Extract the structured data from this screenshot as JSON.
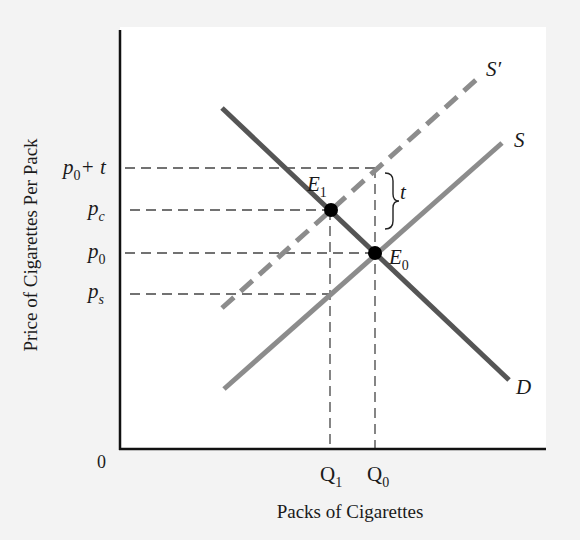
{
  "diagram": {
    "type": "supply-demand-tax",
    "axes": {
      "x_label": "Packs of Cigarettes",
      "y_label": "Price of  Cigarettes Per Pack",
      "origin_label": "0"
    },
    "y_ticks": [
      {
        "id": "p0_plus_t",
        "base": "p",
        "sub": "0",
        "suffix": "+ t",
        "y": 168
      },
      {
        "id": "pc",
        "base": "p",
        "sub": "c",
        "suffix": "",
        "y": 210
      },
      {
        "id": "p0",
        "base": "p",
        "sub": "0",
        "suffix": "",
        "y": 253
      },
      {
        "id": "ps",
        "base": "p",
        "sub": "s",
        "suffix": "",
        "y": 294
      }
    ],
    "x_ticks": [
      {
        "id": "Q1",
        "base": "Q",
        "sub": "1",
        "x": 330
      },
      {
        "id": "Q0",
        "base": "Q",
        "sub": "0",
        "x": 375
      }
    ],
    "curves": [
      {
        "id": "D",
        "label": "D",
        "style": "solid",
        "color": "#555555",
        "from": [
          222,
          108
        ],
        "to": [
          509,
          380
        ]
      },
      {
        "id": "S",
        "label": "S",
        "style": "solid",
        "color": "#8c8c8c",
        "from": [
          224,
          389
        ],
        "to": [
          502,
          143
        ]
      },
      {
        "id": "S_prime",
        "label": "S′",
        "style": "dashed",
        "color": "#8c8c8c",
        "from": [
          222,
          308
        ],
        "to": [
          476,
          80
        ]
      }
    ],
    "points": [
      {
        "id": "E1",
        "base": "E",
        "sub": "1",
        "x": 331,
        "y": 210
      },
      {
        "id": "E0",
        "base": "E",
        "sub": "0",
        "x": 375,
        "y": 253
      }
    ],
    "brace": {
      "label": "t",
      "from_y": 172,
      "to_y": 230
    }
  }
}
